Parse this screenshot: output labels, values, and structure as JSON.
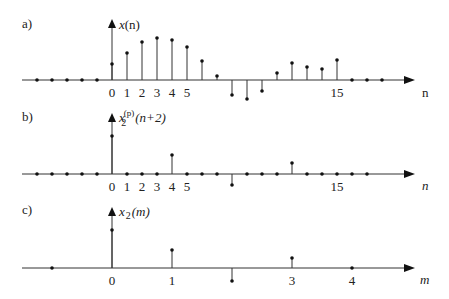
{
  "chart_data": [
    {
      "type": "stem",
      "panel_label": "a)",
      "title": "x(n)",
      "xlabel": "n",
      "x": [
        -5,
        -4,
        -3,
        -2,
        -1,
        0,
        1,
        2,
        3,
        4,
        5,
        6,
        7,
        8,
        9,
        10,
        11,
        12,
        13,
        14,
        15,
        16,
        17,
        18
      ],
      "values": [
        0,
        0,
        0,
        0,
        0,
        16,
        27,
        38,
        42,
        40,
        33,
        19,
        4,
        -15,
        -19,
        -11,
        7,
        17,
        13,
        11,
        20,
        0,
        0,
        0
      ],
      "tick_labels": [
        {
          "x": 0,
          "label": "0"
        },
        {
          "x": 1,
          "label": "1"
        },
        {
          "x": 2,
          "label": "2"
        },
        {
          "x": 3,
          "label": "3"
        },
        {
          "x": 4,
          "label": "4"
        },
        {
          "x": 5,
          "label": "5"
        },
        {
          "x": 15,
          "label": "15"
        }
      ],
      "grid": false
    },
    {
      "type": "stem",
      "panel_label": "b)",
      "title": "x2^(p)(n+2)",
      "xlabel": "n",
      "x": [
        -5,
        -4,
        -3,
        -2,
        -1,
        0,
        1,
        2,
        3,
        4,
        5,
        6,
        7,
        8,
        9,
        10,
        11,
        12,
        13,
        14,
        15,
        16,
        17
      ],
      "values": [
        0,
        0,
        0,
        0,
        0,
        38,
        0,
        0,
        0,
        19,
        0,
        0,
        0,
        -11,
        0,
        0,
        0,
        11,
        0,
        0,
        0,
        0,
        0
      ],
      "tick_labels": [
        {
          "x": 0,
          "label": "0"
        },
        {
          "x": 1,
          "label": "1"
        },
        {
          "x": 2,
          "label": "2"
        },
        {
          "x": 3,
          "label": "3"
        },
        {
          "x": 4,
          "label": "4"
        },
        {
          "x": 5,
          "label": "5"
        },
        {
          "x": 15,
          "label": "15"
        }
      ],
      "grid": false
    },
    {
      "type": "stem",
      "panel_label": "c)",
      "title": "x2(m)",
      "xlabel": "m",
      "x": [
        -1,
        0,
        1,
        2,
        3,
        4
      ],
      "values": [
        0,
        38,
        18,
        -13,
        10,
        0
      ],
      "tick_labels": [
        {
          "x": 0,
          "label": "0"
        },
        {
          "x": 1,
          "label": "1"
        },
        {
          "x": 3,
          "label": "3"
        },
        {
          "x": 4,
          "label": "4"
        }
      ],
      "grid": false
    }
  ],
  "labels": {
    "a": "a)",
    "b": "b)",
    "c": "c)",
    "a_title_x": "x",
    "a_title_arg": "(n)",
    "b_title_x": "x",
    "b_title_sub": "2",
    "b_title_sup": "(p)",
    "b_title_arg": "(n+2)",
    "c_title_x": "x",
    "c_title_sub": "2",
    "c_title_arg": "(m)",
    "a_axis": "n",
    "b_axis": "n",
    "c_axis": "m"
  }
}
